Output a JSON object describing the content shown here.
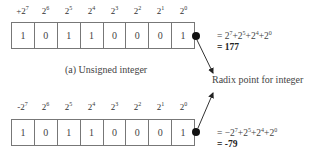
{
  "unsigned": {
    "weights": [
      {
        "prefix": "+",
        "base": "2",
        "exp": "7"
      },
      {
        "prefix": "",
        "base": "2",
        "exp": "6"
      },
      {
        "prefix": "",
        "base": "2",
        "exp": "5"
      },
      {
        "prefix": "",
        "base": "2",
        "exp": "4"
      },
      {
        "prefix": "",
        "base": "2",
        "exp": "3"
      },
      {
        "prefix": "",
        "base": "2",
        "exp": "2"
      },
      {
        "prefix": "",
        "base": "2",
        "exp": "1"
      },
      {
        "prefix": "",
        "base": "2",
        "exp": "0"
      }
    ],
    "bits": [
      "1",
      "0",
      "1",
      "1",
      "0",
      "0",
      "0",
      "1"
    ],
    "equation": "= 2^7+2^5+2^4+2^0",
    "result": "= 177",
    "caption": "(a) Unsigned integer"
  },
  "signed": {
    "weights": [
      {
        "prefix": "-",
        "base": "2",
        "exp": "7"
      },
      {
        "prefix": "",
        "base": "2",
        "exp": "6"
      },
      {
        "prefix": "",
        "base": "2",
        "exp": "5"
      },
      {
        "prefix": "",
        "base": "2",
        "exp": "4"
      },
      {
        "prefix": "",
        "base": "2",
        "exp": "3"
      },
      {
        "prefix": "",
        "base": "2",
        "exp": "2"
      },
      {
        "prefix": "",
        "base": "2",
        "exp": "1"
      },
      {
        "prefix": "",
        "base": "2",
        "exp": "0"
      }
    ],
    "bits": [
      "1",
      "0",
      "1",
      "1",
      "0",
      "0",
      "0",
      "1"
    ],
    "equation": "= -2^7+2^5+2^4+2^0",
    "result": "= -79"
  },
  "radix_label": "Radix point for integer"
}
